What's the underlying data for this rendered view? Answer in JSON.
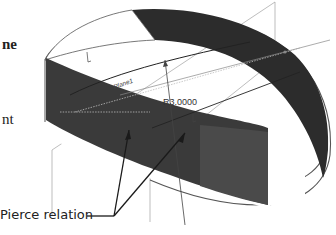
{
  "left_text_fragments": {
    "line1": "ne",
    "line2": "nt"
  },
  "diagram": {
    "plane_label": "Plane1",
    "dimension_label": "R3.0000",
    "callout_label": "Pierce relation",
    "colors": {
      "surface_dark": "#2a2a2a",
      "surface_medium": "#4a4a4a",
      "outline": "#555555",
      "plane_lines": "#9a9a9a",
      "leader_lines": "#1a1a1a"
    }
  }
}
